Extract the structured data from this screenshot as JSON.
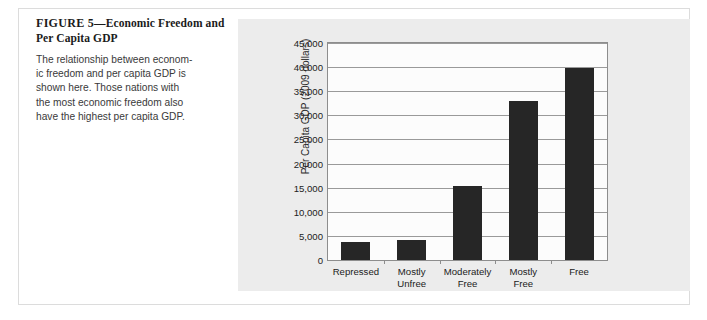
{
  "figure": {
    "number_label": "FIGURE 5",
    "dash": "—",
    "title": "Economic Freedom and Per Capita GDP",
    "title_line1": "Economic Freedom",
    "title_line2": "and Per Capita GDP",
    "caption_lines": [
      "The relationship between econom-",
      "ic freedom and per capita GDP is",
      "shown here. Those nations with",
      "the most economic freedom also",
      "have the highest per capita GDP."
    ]
  },
  "colors": {
    "bar": "#262626",
    "panel_background": "#ececec",
    "plot_background": "#fcfcfc",
    "gridline": "#9a9a9a",
    "axis": "#8d8d8d",
    "frame_border": "#dcdcdc"
  },
  "chart_data": {
    "type": "bar",
    "title": "",
    "xlabel": "",
    "ylabel": "Per Capita GDP (2009 dollars)",
    "categories": [
      "Repressed",
      "Mostly Unfree",
      "Moderately Free",
      "Mostly Free",
      "Free"
    ],
    "category_lines": [
      [
        "Repressed"
      ],
      [
        "Mostly",
        "Unfree"
      ],
      [
        "Moderately",
        "Free"
      ],
      [
        "Mostly",
        "Free"
      ],
      [
        "Free"
      ]
    ],
    "values": [
      3800,
      4200,
      15300,
      33000,
      39800
    ],
    "ylim": [
      0,
      45000
    ],
    "ytick_values": [
      0,
      5000,
      10000,
      15000,
      20000,
      25000,
      30000,
      35000,
      40000,
      45000
    ],
    "ytick_labels": [
      "0",
      "5,000",
      "10,000",
      "15,000",
      "20,000",
      "25,000",
      "30,000",
      "35,000",
      "40,000",
      "45,000"
    ],
    "grid": true,
    "legend": false,
    "legend_position": "none"
  }
}
